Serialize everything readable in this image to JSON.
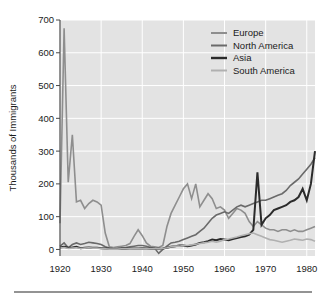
{
  "chart_data": {
    "type": "line",
    "title": "",
    "xlabel": "",
    "ylabel": "Thousands of Immigrants",
    "xlim": [
      1920,
      1982
    ],
    "ylim": [
      -20,
      700
    ],
    "xticks": [
      1920,
      1930,
      1940,
      1950,
      1960,
      1970,
      1980
    ],
    "yticks": [
      0,
      100,
      200,
      300,
      400,
      500,
      600,
      700
    ],
    "xtick_labels": [
      "1920",
      "1930",
      "1940",
      "1950",
      "1960",
      "1970",
      "1980"
    ],
    "ytick_labels": [
      "0",
      "100",
      "200",
      "300",
      "400",
      "500",
      "600",
      "700"
    ],
    "grid": true,
    "legend_position": "top-right",
    "plot_background": "#e3e3e3",
    "gridline_color": "#ffffff",
    "x": [
      1920,
      1921,
      1922,
      1923,
      1924,
      1925,
      1926,
      1927,
      1928,
      1929,
      1930,
      1931,
      1932,
      1933,
      1934,
      1935,
      1936,
      1937,
      1938,
      1939,
      1940,
      1941,
      1942,
      1943,
      1944,
      1945,
      1946,
      1947,
      1948,
      1949,
      1950,
      1951,
      1952,
      1953,
      1954,
      1955,
      1956,
      1957,
      1958,
      1959,
      1960,
      1961,
      1962,
      1963,
      1964,
      1965,
      1966,
      1967,
      1968,
      1969,
      1970,
      1971,
      1972,
      1973,
      1974,
      1975,
      1976,
      1977,
      1978,
      1979,
      1980,
      1981,
      1982
    ],
    "series": [
      {
        "name": "Europe",
        "color": "#8e8e8e",
        "stroke_width": 1.6,
        "values": [
          80,
          675,
          205,
          350,
          145,
          150,
          125,
          140,
          150,
          145,
          135,
          50,
          8,
          6,
          8,
          10,
          12,
          18,
          40,
          60,
          42,
          20,
          10,
          8,
          6,
          12,
          70,
          110,
          135,
          160,
          185,
          200,
          155,
          200,
          130,
          150,
          170,
          155,
          125,
          130,
          120,
          95,
          110,
          125,
          120,
          110,
          85,
          70,
          85,
          75,
          65,
          60,
          60,
          55,
          60,
          60,
          55,
          60,
          55,
          55,
          60,
          65,
          70
        ]
      },
      {
        "name": "North America",
        "color": "#6a6a6a",
        "stroke_width": 1.6,
        "values": [
          10,
          20,
          5,
          15,
          20,
          15,
          18,
          22,
          20,
          18,
          15,
          8,
          4,
          2,
          3,
          5,
          6,
          8,
          10,
          12,
          12,
          10,
          6,
          4,
          -12,
          0,
          10,
          20,
          22,
          25,
          30,
          35,
          40,
          45,
          55,
          65,
          80,
          95,
          105,
          110,
          115,
          110,
          120,
          130,
          135,
          130,
          135,
          140,
          145,
          150,
          150,
          155,
          160,
          165,
          170,
          180,
          195,
          205,
          215,
          230,
          245,
          260,
          280
        ]
      },
      {
        "name": "Asia",
        "color": "#2b2b2b",
        "stroke_width": 2.0,
        "values": [
          6,
          8,
          5,
          6,
          8,
          4,
          5,
          6,
          5,
          5,
          4,
          3,
          2,
          1,
          2,
          2,
          2,
          3,
          3,
          3,
          4,
          3,
          2,
          2,
          2,
          3,
          5,
          8,
          10,
          12,
          12,
          10,
          12,
          15,
          20,
          22,
          25,
          30,
          28,
          32,
          30,
          28,
          32,
          35,
          38,
          40,
          45,
          60,
          235,
          75,
          95,
          105,
          120,
          125,
          130,
          135,
          145,
          150,
          160,
          185,
          150,
          200,
          300
        ]
      },
      {
        "name": "South America",
        "color": "#b0b0b0",
        "stroke_width": 1.6,
        "values": [
          4,
          6,
          3,
          4,
          5,
          3,
          4,
          5,
          4,
          4,
          3,
          2,
          1,
          1,
          1,
          2,
          2,
          2,
          3,
          3,
          3,
          2,
          2,
          2,
          2,
          3,
          5,
          8,
          10,
          10,
          12,
          12,
          14,
          16,
          18,
          20,
          22,
          25,
          22,
          25,
          30,
          32,
          35,
          38,
          42,
          45,
          48,
          50,
          45,
          40,
          35,
          30,
          28,
          25,
          22,
          25,
          28,
          32,
          30,
          28,
          32,
          30,
          25
        ]
      }
    ]
  },
  "legend": {
    "items": [
      {
        "label": "Europe"
      },
      {
        "label": "North America"
      },
      {
        "label": "Asia"
      },
      {
        "label": "South America"
      }
    ]
  },
  "axis": {
    "y_title": "Thousands of Immigrants"
  }
}
